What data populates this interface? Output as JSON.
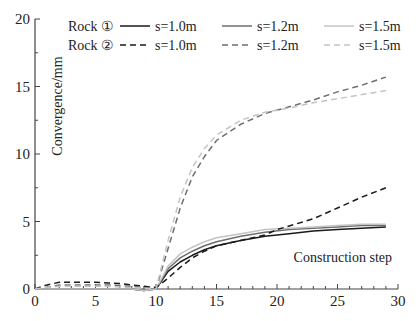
{
  "chart_data": {
    "type": "line",
    "title": "",
    "xlabel": "Construction step",
    "ylabel": "Convergence/mm",
    "xlim": [
      0,
      30
    ],
    "ylim": [
      0,
      20
    ],
    "xticks": [
      0,
      5,
      10,
      15,
      20,
      25,
      30
    ],
    "yticks": [
      0,
      5,
      10,
      15,
      20
    ],
    "grid": false,
    "legend": {
      "placement": "top",
      "groups": [
        {
          "label": "Rock ①",
          "style": "solid"
        },
        {
          "label": "Rock ②",
          "style": "dashed"
        }
      ]
    },
    "series": [
      {
        "name": "s=1.0m",
        "group": "Rock ①",
        "style": "solid",
        "color": "#1a1a1a",
        "x": [
          0,
          1,
          2,
          3,
          4,
          5,
          6,
          7,
          8,
          9,
          10,
          11,
          12,
          13,
          14,
          15,
          17,
          19,
          21,
          23,
          25,
          27,
          29
        ],
        "y": [
          0,
          0,
          0,
          0,
          0,
          0,
          0,
          0,
          0,
          -0.1,
          0,
          1.3,
          2.0,
          2.5,
          2.9,
          3.2,
          3.6,
          3.9,
          4.1,
          4.3,
          4.4,
          4.5,
          4.6
        ]
      },
      {
        "name": "s=1.2m",
        "group": "Rock ①",
        "style": "solid",
        "color": "#6e6e6e",
        "x": [
          0,
          1,
          2,
          3,
          4,
          5,
          6,
          7,
          8,
          9,
          10,
          11,
          12,
          13,
          14,
          15,
          17,
          19,
          21,
          23,
          25,
          27,
          29
        ],
        "y": [
          0,
          0,
          0,
          0,
          0,
          0,
          0,
          0,
          0,
          -0.1,
          0,
          1.5,
          2.3,
          2.8,
          3.2,
          3.5,
          3.9,
          4.2,
          4.4,
          4.5,
          4.6,
          4.7,
          4.7
        ]
      },
      {
        "name": "s=1.5m",
        "group": "Rock ①",
        "style": "solid",
        "color": "#c4c4c4",
        "x": [
          0,
          1,
          2,
          3,
          4,
          5,
          6,
          7,
          8,
          9,
          10,
          11,
          12,
          13,
          14,
          15,
          17,
          19,
          21,
          23,
          25,
          27,
          29
        ],
        "y": [
          0,
          0,
          0,
          0,
          0,
          0,
          0,
          0,
          0,
          -0.1,
          0,
          1.7,
          2.6,
          3.1,
          3.5,
          3.8,
          4.1,
          4.4,
          4.5,
          4.6,
          4.7,
          4.8,
          4.8
        ]
      },
      {
        "name": "s=1.0m",
        "group": "Rock ②",
        "style": "dashed",
        "color": "#1a1a1a",
        "x": [
          0,
          1,
          2,
          3,
          4,
          5,
          6,
          7,
          8,
          9,
          10,
          11,
          12,
          13,
          14,
          15,
          17,
          19,
          20,
          23,
          25,
          27,
          29
        ],
        "y": [
          0,
          0.3,
          0.5,
          0.5,
          0.5,
          0.5,
          0.45,
          0.4,
          0.3,
          0.2,
          0.1,
          0.8,
          1.6,
          2.3,
          2.8,
          3.2,
          3.6,
          4.0,
          4.4,
          5.2,
          6.0,
          6.8,
          7.5
        ]
      },
      {
        "name": "s=1.2m",
        "group": "Rock ②",
        "style": "dashed",
        "color": "#6e6e6e",
        "x": [
          0,
          1,
          2,
          3,
          4,
          5,
          6,
          7,
          8,
          9,
          10,
          11,
          12,
          13,
          14,
          15,
          17,
          19,
          21,
          23,
          25,
          27,
          29
        ],
        "y": [
          0,
          0.1,
          0.3,
          0.3,
          0.3,
          0.3,
          0.3,
          0.25,
          0.2,
          0.1,
          0,
          3.0,
          6.0,
          8.3,
          9.8,
          11.0,
          12.2,
          13.0,
          13.5,
          14.0,
          14.6,
          15.1,
          15.7
        ]
      },
      {
        "name": "s=1.5m",
        "group": "Rock ②",
        "style": "dashed",
        "color": "#c4c4c4",
        "x": [
          0,
          1,
          2,
          3,
          4,
          5,
          6,
          7,
          8,
          9,
          10,
          11,
          12,
          13,
          14,
          15,
          17,
          19,
          21,
          23,
          25,
          27,
          29
        ],
        "y": [
          0,
          0.1,
          0.2,
          0.2,
          0.2,
          0.2,
          0.2,
          0.15,
          0.1,
          0.05,
          0,
          3.6,
          6.8,
          9.0,
          10.4,
          11.4,
          12.5,
          13.1,
          13.4,
          13.8,
          14.1,
          14.4,
          14.7
        ]
      }
    ]
  }
}
